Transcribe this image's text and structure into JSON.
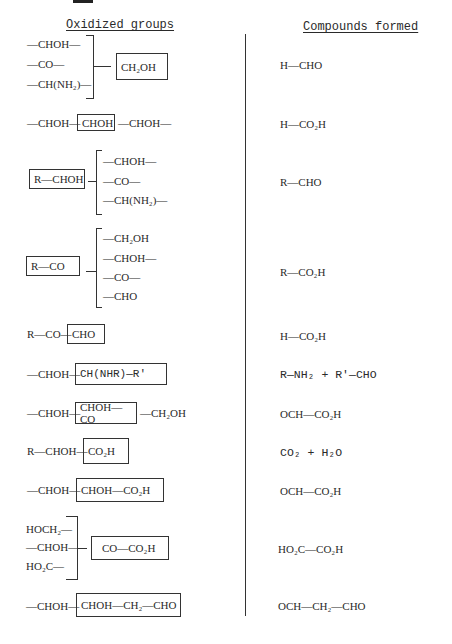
{
  "headers": {
    "left": "Oxidized groups",
    "right": "Compounds formed"
  },
  "rows": [
    {
      "oxidized": {
        "bracket_left": [
          "—CHOH—",
          "—CO—",
          "—CH(NH₂)—"
        ],
        "boxed": "CH₂OH"
      },
      "formed": "H—CHO"
    },
    {
      "oxidized": {
        "prefix": "—CHOH—",
        "boxed": "CHOH",
        "suffix": "—CHOH—"
      },
      "formed": "H—CO₂H"
    },
    {
      "oxidized": {
        "boxed": "R—CHOH",
        "bracket_right": [
          "—CHOH—",
          "—CO—",
          "—CH(NH₂)—"
        ]
      },
      "formed": "R—CHO"
    },
    {
      "oxidized": {
        "boxed": "R—CO",
        "bracket_right": [
          "—CH₂OH",
          "—CHOH—",
          "—CO—",
          "—CHO"
        ]
      },
      "formed": "R—CO₂H"
    },
    {
      "oxidized": {
        "prefix": "R—CO—",
        "boxed": "CHO"
      },
      "formed": "H—CO₂H"
    },
    {
      "oxidized": {
        "prefix": "—CHOH—",
        "boxed": "CH(NHR)—R'"
      },
      "formed": "R—NH₂ + R'—CHO"
    },
    {
      "oxidized": {
        "prefix": "—CHOH—",
        "boxed": "CHOH—CO",
        "suffix": "—CH₂OH"
      },
      "formed": "OCH—CO₂H"
    },
    {
      "oxidized": {
        "prefix": "R—CHOH—",
        "boxed": "CO₂H"
      },
      "formed": "CO₂ + H₂O"
    },
    {
      "oxidized": {
        "prefix": "—CHOH—",
        "boxed": "CHOH—CO₂H"
      },
      "formed": "OCH—CO₂H"
    },
    {
      "oxidized": {
        "bracket_left": [
          "HOCH₂—",
          "—CHOH—",
          "HO₂C—"
        ],
        "boxed": "CO—CO₂H"
      },
      "formed": "HO₂C—CO₂H"
    },
    {
      "oxidized": {
        "prefix": "—CHOH—",
        "boxed": "CHOH—CH₂—CHO"
      },
      "formed": "OCH—CH₂—CHO"
    }
  ]
}
